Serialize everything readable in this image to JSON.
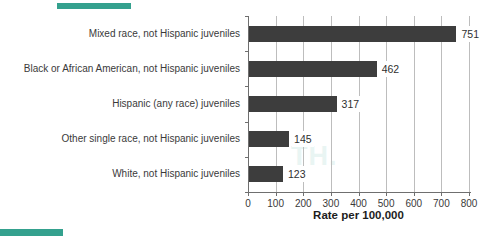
{
  "chart_data": {
    "type": "bar",
    "orientation": "horizontal",
    "title": "",
    "categories": [
      "Mixed race, not Hispanic juveniles",
      "Black or African American, not Hispanic juveniles",
      "Hispanic (any race) juveniles",
      "Other single race, not Hispanic juveniles",
      "White, not Hispanic juveniles"
    ],
    "values": [
      751,
      462,
      317,
      145,
      123
    ],
    "data_labels": [
      "751",
      "462",
      "317",
      "145",
      "123"
    ],
    "xlabel": "Rate per 100,000",
    "x_ticks": [
      0,
      100,
      200,
      300,
      400,
      500,
      600,
      700,
      800
    ],
    "x_tick_labels": [
      "0",
      "100",
      "200",
      "300",
      "400",
      "500",
      "600",
      "700",
      "800"
    ],
    "xlim": [
      0,
      800
    ],
    "grid": "vertical",
    "legend": "none",
    "colors": {
      "bar": "#3d3d3d",
      "gridline": "#bdbdbd",
      "axis": "#6f6f6f",
      "category_text": "#3a3a3a",
      "value_text": "#2f2f2f",
      "tick_text": "#3a3a3a",
      "axis_label_text": "#1d1d1d"
    }
  },
  "decor": {
    "accent_color": "#34a18e",
    "watermark_text": "TH."
  }
}
